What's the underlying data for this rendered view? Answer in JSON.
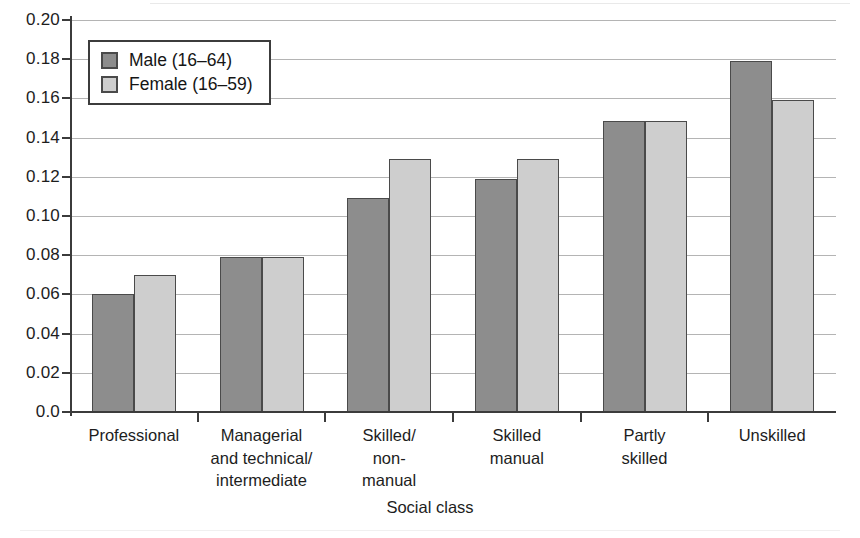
{
  "chart_data": {
    "type": "bar",
    "title": "",
    "xlabel": "Social class",
    "ylabel": "",
    "ylim": [
      0.0,
      0.2
    ],
    "ytick_step": 0.02,
    "ytick_labels": [
      "0.20",
      "0.18",
      "0.16",
      "0.14",
      "0.12",
      "0.10",
      "0.08",
      "0.06",
      "0.04",
      "0.02",
      "0.0"
    ],
    "ytick_values": [
      0.2,
      0.18,
      0.16,
      0.14,
      0.12,
      0.1,
      0.08,
      0.06,
      0.04,
      0.02,
      0.0
    ],
    "grid": "horizontal",
    "legend_position": "top-left-inside",
    "categories": [
      "Professional",
      "Managerial and technical/ intermediate",
      "Skilled/ non-manual",
      "Skilled manual",
      "Partly skilled",
      "Unskilled"
    ],
    "category_label_lines": [
      [
        "Professional"
      ],
      [
        "Managerial",
        "and technical/",
        "intermediate"
      ],
      [
        "Skilled/",
        "non-",
        "manual"
      ],
      [
        "Skilled",
        "manual"
      ],
      [
        "Partly",
        "skilled"
      ],
      [
        "Unskilled"
      ]
    ],
    "series": [
      {
        "name": "Male (16–64)",
        "color": "#8d8d8d",
        "values": [
          0.06,
          0.079,
          0.109,
          0.119,
          0.1485,
          0.179
        ]
      },
      {
        "name": "Female (16–59)",
        "color": "#cecece",
        "values": [
          0.07,
          0.079,
          0.129,
          0.129,
          0.1485,
          0.159
        ]
      }
    ]
  },
  "legend": {
    "items": [
      {
        "label": "Male (16–64)",
        "swatch": "male"
      },
      {
        "label": "Female (16–59)",
        "swatch": "female"
      }
    ]
  },
  "axis": {
    "x_title": "Social class"
  },
  "colors": {
    "series_male": "#8d8d8d",
    "series_female": "#cecece",
    "bar_border": "#4a4a4a",
    "axis": "#3b3b3b",
    "gridline": "#b4b4b4",
    "background": "#ffffff"
  }
}
